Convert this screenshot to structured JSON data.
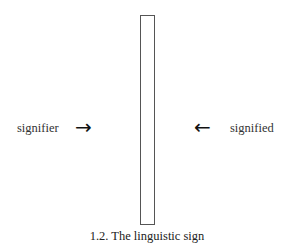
{
  "diagram": {
    "left_label": "signifier",
    "left_arrow": "→",
    "right_arrow": "←",
    "right_label": "signified",
    "caption": "1.2.  The linguistic sign",
    "bar_color": "#555555"
  }
}
